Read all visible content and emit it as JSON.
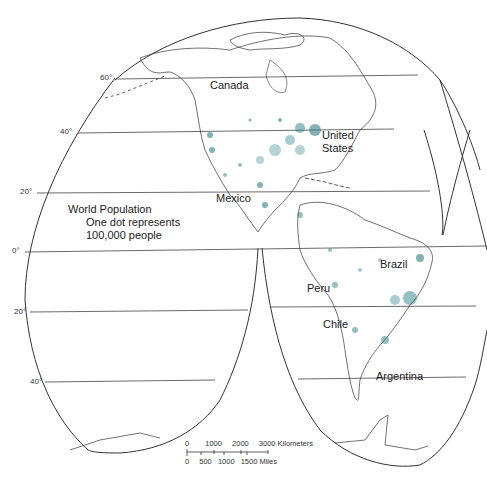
{
  "map": {
    "type": "interrupted projection world population dot map (Americas lobe)",
    "legend": {
      "title": "World Population",
      "line1": "One dot represents",
      "line2": "100,000 people"
    },
    "dot_color": "#2e7f86",
    "line_color": "#333333",
    "latitude_labels": {
      "n60": "60°",
      "n40": "40°",
      "n20": "20°",
      "eq": "0°",
      "s20": "20°",
      "s40": "40°"
    },
    "country_labels": {
      "canada": "Canada",
      "us_line1": "United",
      "us_line2": "States",
      "mexico": "Mexico",
      "brazil": "Brazil",
      "peru": "Peru",
      "chile": "Chile",
      "argentina": "Argentina"
    },
    "scale_bar": {
      "km_ticks": [
        "0",
        "1000",
        "2000",
        "3000 Kilometers"
      ],
      "mile_ticks": [
        "0",
        "500",
        "1000",
        "1500 Miles"
      ]
    }
  }
}
